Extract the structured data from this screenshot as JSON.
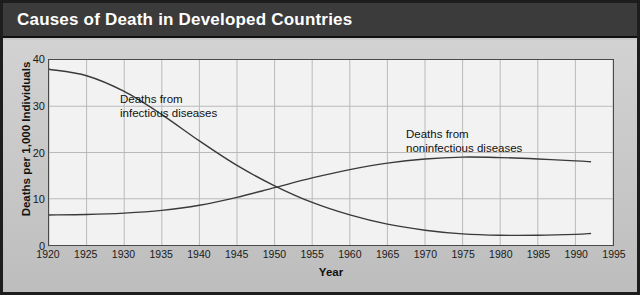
{
  "header": {
    "title": "Causes of Death in Developed Countries"
  },
  "chart_data": {
    "type": "line",
    "title": "Causes of Death in Developed Countries",
    "xlabel": "Year",
    "ylabel": "Deaths per 1,000 Individuals",
    "xlim": [
      1920,
      1995
    ],
    "ylim": [
      0,
      40
    ],
    "xticks": [
      1920,
      1925,
      1930,
      1935,
      1940,
      1945,
      1950,
      1955,
      1960,
      1965,
      1970,
      1975,
      1980,
      1985,
      1990,
      1995
    ],
    "yticks": [
      0,
      10,
      20,
      30,
      40
    ],
    "grid": true,
    "legend_position": "inline-annotations",
    "line_color": "#3a3a3a",
    "plot_background": "#f2f2f2",
    "panel_background": "#c9c9c9",
    "title_background": "#3b3b3b",
    "title_color": "#ffffff",
    "x": [
      1920,
      1925,
      1930,
      1935,
      1940,
      1945,
      1950,
      1955,
      1960,
      1965,
      1970,
      1975,
      1980,
      1985,
      1990,
      1992
    ],
    "series": [
      {
        "name": "Deaths from infectious diseases",
        "annotation": "Deaths from\ninfectious diseases",
        "annotation_lines": [
          "Deaths from",
          "infectious diseases"
        ],
        "values": [
          38.0,
          36.6,
          33.2,
          28.2,
          22.5,
          17.2,
          12.8,
          9.2,
          6.5,
          4.5,
          3.2,
          2.4,
          2.1,
          2.1,
          2.3,
          2.5
        ]
      },
      {
        "name": "Deaths from noninfectious diseases",
        "annotation": "Deaths from\nnoninfectious diseases",
        "annotation_lines": [
          "Deaths from",
          "noninfectious diseases"
        ],
        "values": [
          6.5,
          6.6,
          6.9,
          7.5,
          8.6,
          10.3,
          12.4,
          14.5,
          16.3,
          17.7,
          18.6,
          19.0,
          18.9,
          18.6,
          18.2,
          18.0
        ]
      }
    ],
    "crossover": {
      "year": 1945,
      "value": 11.0
    }
  },
  "axis": {
    "ytick_labels": [
      "40",
      "30",
      "20",
      "10",
      "0"
    ],
    "xtick_labels": [
      "1920",
      "1925",
      "1930",
      "1935",
      "1940",
      "1945",
      "1950",
      "1955",
      "1960",
      "1965",
      "1970",
      "1975",
      "1980",
      "1985",
      "1990",
      "1995"
    ],
    "ylabel": "Deaths per 1,000 Individuals",
    "xlabel": "Year"
  },
  "annotations": {
    "infectious_line1": "Deaths from",
    "infectious_line2": "infectious diseases",
    "noninfectious_line1": "Deaths from",
    "noninfectious_line2": "noninfectious diseases"
  }
}
